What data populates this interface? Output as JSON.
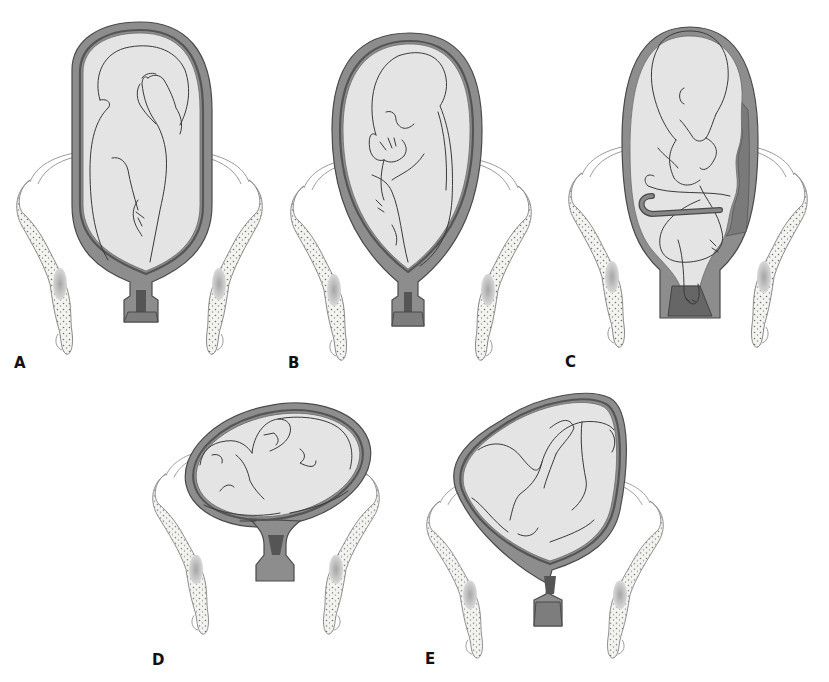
{
  "figure": {
    "colors": {
      "uterine_wall": "#8d8d8d",
      "amniotic_sac": "#e4e4e4",
      "outline": "#3a3a3a",
      "bone_fill": "#f3f3f0",
      "background": "#ffffff"
    },
    "panels": [
      {
        "id": "A",
        "label": "A",
        "subject": "frank-breech"
      },
      {
        "id": "B",
        "label": "B",
        "subject": "complete-breech"
      },
      {
        "id": "C",
        "label": "C",
        "subject": "footling-breech"
      },
      {
        "id": "D",
        "label": "D",
        "subject": "transverse-lie"
      },
      {
        "id": "E",
        "label": "E",
        "subject": "oblique-lie"
      }
    ]
  }
}
